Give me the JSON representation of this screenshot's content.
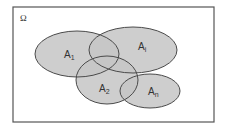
{
  "diagram": {
    "type": "venn",
    "universe": {
      "label": "Ω"
    },
    "sets": [
      {
        "name": "A",
        "sub": "1"
      },
      {
        "name": "A",
        "sub": "i"
      },
      {
        "name": "A",
        "sub": "2"
      },
      {
        "name": "A",
        "sub": "n"
      }
    ],
    "colors": {
      "fill": "#c6c6c6",
      "stroke": "#4a4a4a",
      "border": "#555555",
      "background": "#ffffff"
    }
  }
}
